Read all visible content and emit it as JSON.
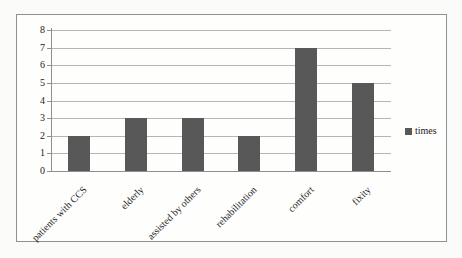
{
  "chart_data": {
    "type": "bar",
    "title": "",
    "categories": [
      "patients with CCS",
      "elderly",
      "assisted by others",
      "rehabilitation",
      "comfort",
      "fixity"
    ],
    "series": [
      {
        "name": "times",
        "values": [
          2,
          3,
          3,
          2,
          7,
          5
        ]
      }
    ],
    "xlabel": "",
    "ylabel": "",
    "ylim": [
      0,
      8
    ],
    "y_ticks": [
      0,
      1,
      2,
      3,
      4,
      5,
      6,
      7,
      8
    ],
    "grid": "horizontal",
    "legend_position": "right",
    "bar_color": "#585858",
    "gridline_color": "#b5b5b5",
    "axis_color": "#8f8f8f"
  },
  "legend": {
    "label": "times"
  }
}
